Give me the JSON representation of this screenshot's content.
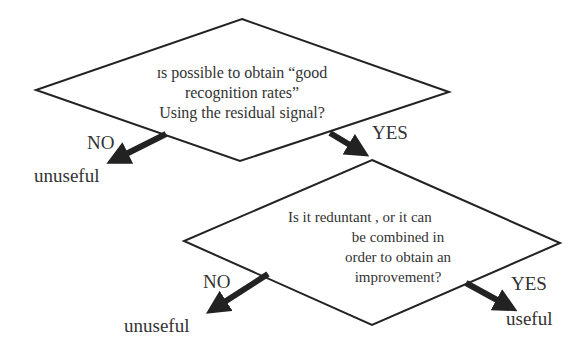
{
  "colors": {
    "line": "#222222",
    "arrow": "#222222",
    "text": "#333333",
    "background": "#ffffff"
  },
  "decision1": {
    "lines": [
      "ɪs possible to obtain “good",
      "recognition rates”",
      "Using the residual signal?"
    ],
    "no_label": "NO",
    "no_outcome": "unuseful",
    "yes_label": "YES"
  },
  "decision2": {
    "lines": [
      "Is it reduntant , or it can",
      "be combined in",
      "order to obtain an",
      "improvement?"
    ],
    "no_label": "NO",
    "no_outcome": "unuseful",
    "yes_label": "YES",
    "yes_outcome": "useful"
  }
}
